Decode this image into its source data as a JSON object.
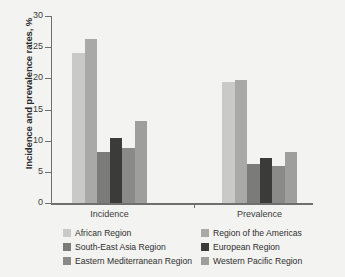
{
  "chart_data": {
    "type": "bar",
    "title": "",
    "subtitle": "",
    "xlabel": "",
    "ylabel": "Incidence and prevalence rates, %",
    "categories": [
      "Incidence",
      "Prevalence"
    ],
    "ylim": [
      0,
      30
    ],
    "yticks": [
      0,
      5,
      10,
      15,
      20,
      25,
      30
    ],
    "ytick_labels": [
      "0",
      "5",
      "10",
      "15",
      "20",
      "25",
      "30"
    ],
    "grid": false,
    "legend_position": "bottom",
    "series": [
      {
        "name": "African Region",
        "color": "#c9c9c7",
        "values": [
          24.1,
          19.4
        ]
      },
      {
        "name": "Region of the Americas",
        "color": "#a9a9a7",
        "values": [
          26.3,
          19.7
        ]
      },
      {
        "name": "South-East Asia Region",
        "color": "#7b7b79",
        "values": [
          8.2,
          6.2
        ]
      },
      {
        "name": "European Region",
        "color": "#3b3b3a",
        "values": [
          10.4,
          7.3
        ]
      },
      {
        "name": "Eastern Mediterranean Region",
        "color": "#8a8a88",
        "values": [
          8.8,
          5.9
        ]
      },
      {
        "name": "Western Pacific Region",
        "color": "#9e9e9c",
        "values": [
          13.1,
          8.2
        ]
      }
    ]
  },
  "axis": {
    "y_title": "Incidence and prevalence rates, %"
  },
  "legend": {
    "items": [
      {
        "label": "African Region",
        "color": "#c9c9c7"
      },
      {
        "label": "Region of the Americas",
        "color": "#a9a9a7"
      },
      {
        "label": "South-East Asia Region",
        "color": "#7b7b79"
      },
      {
        "label": "European Region",
        "color": "#3b3b3a"
      },
      {
        "label": "Eastern Mediterranean Region",
        "color": "#8a8a88"
      },
      {
        "label": "Western Pacific Region",
        "color": "#9e9e9c"
      }
    ]
  }
}
